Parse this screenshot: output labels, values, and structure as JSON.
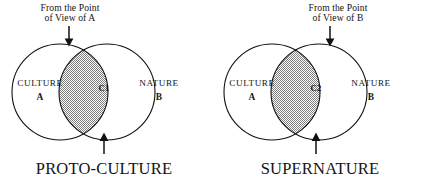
{
  "figure": {
    "background_color": "#ffffff",
    "stroke_color": "#111111",
    "fill_pattern": "dotted-stipple",
    "fill_color": "#8d8d8d"
  },
  "diagrams": [
    {
      "id": "proto-culture",
      "pov_note": "From the Point\nof View of A",
      "pov_arrow": "down-arrow",
      "left_set": {
        "label": "CULTURE",
        "letter": "A"
      },
      "right_set": {
        "label": "NATURE",
        "letter": "B"
      },
      "intersection": {
        "label": "C1"
      },
      "caption": "PROTO-CULTURE",
      "caption_arrow": "up-arrow"
    },
    {
      "id": "supernature",
      "pov_note": "From the Point\nof View of B",
      "pov_arrow": "down-arrow",
      "left_set": {
        "label": "CULTURE",
        "letter": "A"
      },
      "right_set": {
        "label": "NATURE",
        "letter": "B"
      },
      "intersection": {
        "label": "C2"
      },
      "caption": "SUPERNATURE",
      "caption_arrow": "up-arrow"
    }
  ]
}
